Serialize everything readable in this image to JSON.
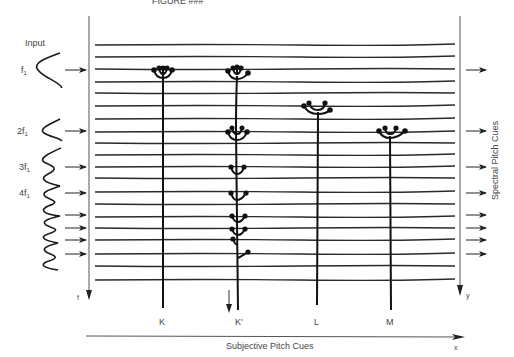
{
  "figure": {
    "title_fragment": "FIGURE ###",
    "input_label": "Input",
    "harmonics": [
      {
        "label": "f",
        "sub": "1",
        "y": 70
      },
      {
        "label": "2f",
        "sub": "1",
        "y": 131
      },
      {
        "label": "3f",
        "sub": "1",
        "y": 167
      },
      {
        "label": "4f",
        "sub": "1",
        "y": 193
      }
    ],
    "left_axis_label": "f",
    "right_axis_label": "y",
    "right_axis_title": "Spectral Pitch Cues",
    "bottom_axis_title": "Subjective Pitch Cues",
    "bottom_axis_label": "x",
    "trees": [
      {
        "label": "K",
        "x": 163
      },
      {
        "label": "K'",
        "x": 238
      },
      {
        "label": "L",
        "x": 318
      },
      {
        "label": "M",
        "x": 390
      }
    ],
    "line_ys": [
      45,
      57,
      69,
      82,
      93,
      106,
      119,
      132,
      143,
      155,
      167,
      178,
      192,
      204,
      217,
      228,
      240,
      254,
      266,
      280
    ],
    "input_arrow_ys": [
      70,
      131,
      167,
      193,
      215,
      228,
      240,
      254
    ],
    "output_arrow_ys": [
      70,
      131,
      167,
      193,
      215,
      228,
      240,
      254
    ],
    "colors": {
      "ink": "#1a1a1a",
      "line": "#2a2a2a",
      "text": "#444444",
      "background": "#ffffff"
    }
  }
}
